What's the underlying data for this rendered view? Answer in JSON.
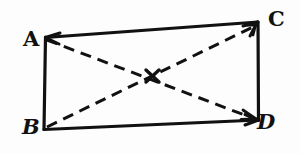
{
  "figure": {
    "kind": "geometry-sketch",
    "background_color": "#fdfdfd",
    "ink_color": "#111111",
    "vertices": [
      {
        "id": "A",
        "label": "A",
        "x": 45,
        "y": 37,
        "label_x": 23,
        "label_y": 28,
        "style": "upright"
      },
      {
        "id": "C",
        "label": "C",
        "x": 258,
        "y": 22,
        "label_x": 268,
        "label_y": 8,
        "style": "upright"
      },
      {
        "id": "B",
        "label": "B",
        "x": 44,
        "y": 129,
        "label_x": 22,
        "label_y": 116,
        "style": "italic"
      },
      {
        "id": "D",
        "label": "D",
        "x": 258,
        "y": 120,
        "label_x": 257,
        "label_y": 111,
        "style": "italic"
      }
    ],
    "edges": [
      {
        "id": "AC",
        "from": "A",
        "to": "C",
        "style": "solid",
        "arrow_start": true,
        "arrow_end": true
      },
      {
        "id": "AB",
        "from": "A",
        "to": "B",
        "style": "solid",
        "arrow_start": false,
        "arrow_end": false
      },
      {
        "id": "BD",
        "from": "B",
        "to": "D",
        "style": "solid",
        "arrow_start": false,
        "arrow_end": true
      },
      {
        "id": "CD",
        "from": "C",
        "to": "D",
        "style": "solid",
        "arrow_start": false,
        "arrow_end": false
      }
    ],
    "diagonals": [
      {
        "id": "AD",
        "from": "A",
        "to": "D",
        "style": "dashed",
        "arrow_start": false,
        "arrow_end": true
      },
      {
        "id": "BC",
        "from": "B",
        "to": "C",
        "style": "dashed",
        "arrow_start": false,
        "arrow_end": true
      }
    ],
    "intersection": {
      "x": 152,
      "y": 76,
      "marker": "x-cross"
    },
    "stroke_width_solid": 3.2,
    "stroke_width_dashed": 3.0,
    "dash_pattern": "11 7"
  }
}
